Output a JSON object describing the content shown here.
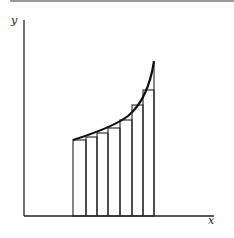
{
  "diagram": {
    "type": "riemann-sum-left-endpoint",
    "axes": {
      "x_label": "x",
      "y_label": "y"
    },
    "curve": "increasing convex function",
    "rectangle_count": 7,
    "rectangles": [
      {
        "x0": 73,
        "x1": 86,
        "top": 140
      },
      {
        "x0": 86,
        "x1": 97,
        "top": 137
      },
      {
        "x0": 97,
        "x1": 108,
        "top": 133
      },
      {
        "x0": 108,
        "x1": 120,
        "top": 128
      },
      {
        "x0": 120,
        "x1": 132,
        "top": 120
      },
      {
        "x0": 132,
        "x1": 143,
        "top": 105
      },
      {
        "x0": 143,
        "x1": 154,
        "top": 90
      }
    ],
    "colors": {
      "stroke": "#222222",
      "header_rule": "#9a9a9a"
    }
  }
}
